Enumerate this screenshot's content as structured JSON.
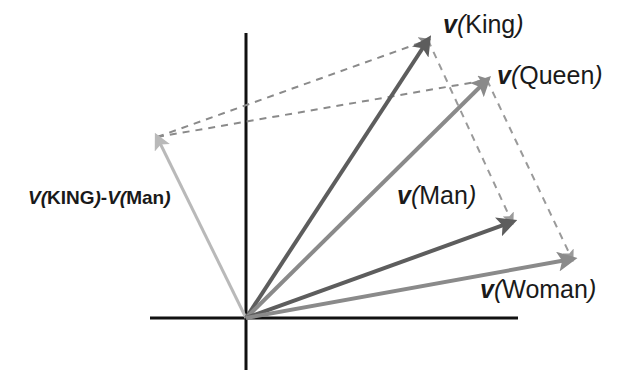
{
  "figure": {
    "domain": "diagram",
    "type": "vector-space-analogy-diagram",
    "width": 634,
    "height": 378,
    "background_color": "#ffffff"
  },
  "axes": {
    "origin": {
      "x": 246,
      "y": 318
    },
    "x_axis": {
      "x1": 150,
      "y1": 318,
      "x2": 518,
      "y2": 318,
      "color": "#111111",
      "width": 3
    },
    "y_axis": {
      "x1": 246,
      "y1": 33,
      "x2": 246,
      "y2": 370,
      "color": "#111111",
      "width": 3
    }
  },
  "vectors": [
    {
      "id": "king",
      "label_v": "v",
      "label_open": "(",
      "label_word": "King",
      "label_close": ")",
      "label_text": "v(King)",
      "from": {
        "x": 246,
        "y": 318
      },
      "to": {
        "x": 428,
        "y": 40
      },
      "color": "#5d5d5d",
      "width": 4,
      "style": "solid"
    },
    {
      "id": "queen",
      "label_v": "v",
      "label_open": "(",
      "label_word": "Queen",
      "label_close": ")",
      "label_text": "v(Queen)",
      "from": {
        "x": 246,
        "y": 318
      },
      "to": {
        "x": 487,
        "y": 80
      },
      "color": "#8a8a8a",
      "width": 4,
      "style": "solid"
    },
    {
      "id": "man",
      "label_v": "v",
      "label_open": "(",
      "label_word": "Man",
      "label_close": ")",
      "label_text": "v(Man)",
      "from": {
        "x": 246,
        "y": 318
      },
      "to": {
        "x": 512,
        "y": 222
      },
      "color": "#5d5d5d",
      "width": 4,
      "style": "solid"
    },
    {
      "id": "woman",
      "label_v": "v",
      "label_open": "(",
      "label_word": "Woman",
      "label_close": ")",
      "label_text": "v(Woman)",
      "from": {
        "x": 246,
        "y": 318
      },
      "to": {
        "x": 572,
        "y": 259
      },
      "color": "#8a8a8a",
      "width": 4,
      "style": "solid"
    },
    {
      "id": "difference",
      "label_v": "V",
      "label_open": "(",
      "label_word": "KING",
      "label_close": ")",
      "label_minus": "-",
      "label_v2": "V",
      "label_open2": "(",
      "label_word2": "Man",
      "label_close2": ")",
      "label_text": "V(KING)-V(Man)",
      "from": {
        "x": 246,
        "y": 318
      },
      "to": {
        "x": 157,
        "y": 137
      },
      "color": "#b9b9b9",
      "width": 3,
      "style": "solid"
    }
  ],
  "dashed_connectors": [
    {
      "id": "diff-to-king",
      "from": {
        "x": 157,
        "y": 137
      },
      "to": {
        "x": 428,
        "y": 40
      },
      "color": "#8a8a8a",
      "width": 2,
      "dash": "7,6",
      "arrowhead": "end"
    },
    {
      "id": "diff-to-queen",
      "from": {
        "x": 157,
        "y": 137
      },
      "to": {
        "x": 487,
        "y": 80
      },
      "color": "#8a8a8a",
      "width": 2,
      "dash": "7,6",
      "arrowhead": "end"
    },
    {
      "id": "king-to-man",
      "from": {
        "x": 428,
        "y": 40
      },
      "to": {
        "x": 512,
        "y": 222
      },
      "color": "#9a9a9a",
      "width": 2,
      "dash": "7,6",
      "arrowhead": "end"
    },
    {
      "id": "queen-to-woman",
      "from": {
        "x": 487,
        "y": 80
      },
      "to": {
        "x": 572,
        "y": 259
      },
      "color": "#9a9a9a",
      "width": 2,
      "dash": "7,6",
      "arrowhead": "end"
    }
  ],
  "colors": {
    "axis": "#111111",
    "vector_dark": "#5d5d5d",
    "vector_mid": "#8a8a8a",
    "vector_light": "#b9b9b9",
    "dashed": "#8a8a8a",
    "text": "#1a1a1a"
  }
}
